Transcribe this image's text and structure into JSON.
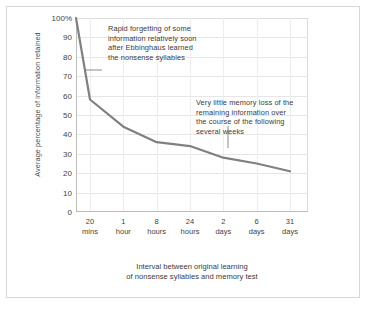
{
  "chart_data": {
    "type": "line",
    "title": "",
    "xlabel": "Interval between original learning\nof nonsense syllables and memory test",
    "ylabel": "Average percentage of information retained",
    "ylim": [
      0,
      100
    ],
    "grid": true,
    "legend": "none",
    "categories": [
      "0",
      "20 mins",
      "1 hour",
      "8 hours",
      "24 hours",
      "2 days",
      "6 days",
      "31 days"
    ],
    "x": [
      "0",
      "20\nmins",
      "1\nhour",
      "8\nhours",
      "24\nhours",
      "2\ndays",
      "6\ndays",
      "31\ndays"
    ],
    "values": [
      100,
      58,
      44,
      36,
      34,
      28,
      25,
      21
    ],
    "series": [
      {
        "name": "Information retained",
        "values": [
          100,
          58,
          44,
          36,
          34,
          28,
          25,
          21
        ]
      }
    ],
    "yticks": [
      "100%",
      "90",
      "80",
      "70",
      "60",
      "50",
      "40",
      "30",
      "20",
      "10",
      "0"
    ],
    "ytick_values": [
      100,
      90,
      80,
      70,
      60,
      50,
      40,
      30,
      20,
      10,
      0
    ],
    "xticks": [
      {
        "line1": "20",
        "line2": "mins"
      },
      {
        "line1": "1",
        "line2": "hour"
      },
      {
        "line1": "8",
        "line2": "hours"
      },
      {
        "line1": "24",
        "line2": "hours"
      },
      {
        "line1": "2",
        "line2": "days"
      },
      {
        "line1": "6",
        "line2": "days"
      },
      {
        "line1": "31",
        "line2": "days"
      }
    ],
    "annotations": [
      {
        "id": "rapid-forgetting",
        "text": "Rapid forgetting of some\ninformation relatively soon\nafter Ebbinghaus learned\nthe nonsense syllables"
      },
      {
        "id": "little-memory-loss",
        "text": "Very little memory loss of the\nremaining information over\nthe course of the following\nseveral weeks"
      }
    ],
    "colors": {
      "line": "#808080",
      "grid": "#e6e6e6",
      "axis": "#bdbdbd",
      "text": "#3b3b3b",
      "background": "#ffffff"
    }
  }
}
